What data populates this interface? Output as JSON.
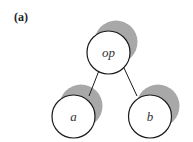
{
  "figure": {
    "label": "(a)"
  },
  "tree": {
    "nodes": [
      {
        "id": "op",
        "label": "op",
        "role": "root"
      },
      {
        "id": "a",
        "label": "a",
        "role": "left-child"
      },
      {
        "id": "b",
        "label": "b",
        "role": "right-child"
      }
    ],
    "edges": [
      {
        "from": "op",
        "to": "a"
      },
      {
        "from": "op",
        "to": "b"
      }
    ]
  },
  "colors": {
    "shadow": "#a8a8a8",
    "stroke": "#1a1a1a",
    "fill": "#ffffff"
  }
}
